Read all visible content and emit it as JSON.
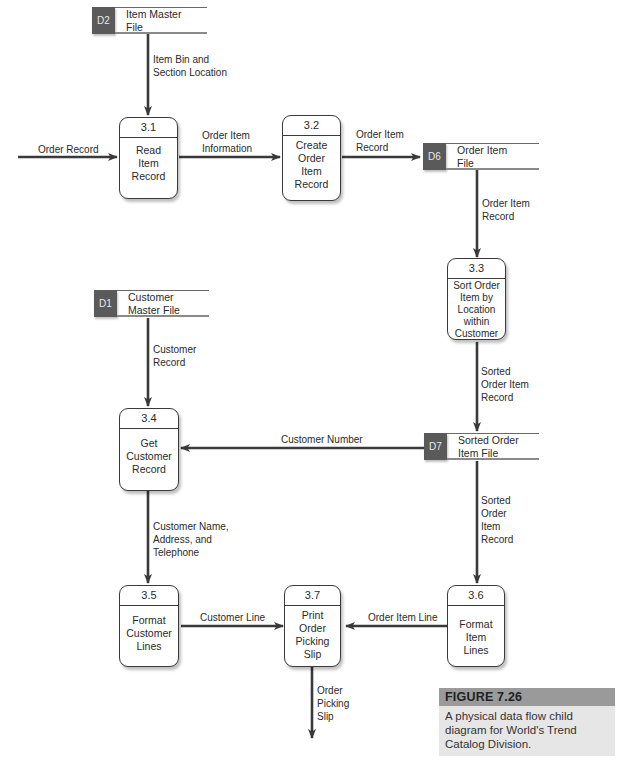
{
  "figure": {
    "title": "FIGURE 7.26",
    "caption": "A physical data flow child diagram for World's Trend Catalog Division."
  },
  "data_stores": {
    "d2": {
      "id": "D2",
      "name": "Item Master\nFile"
    },
    "d6": {
      "id": "D6",
      "name": "Order Item\nFile"
    },
    "d1": {
      "id": "D1",
      "name": "Customer\nMaster File"
    },
    "d7": {
      "id": "D7",
      "name": "Sorted Order\nItem File"
    }
  },
  "processes": {
    "p31": {
      "id": "3.1",
      "name": "Read\nItem\nRecord"
    },
    "p32": {
      "id": "3.2",
      "name": "Create\nOrder\nItem\nRecord"
    },
    "p33": {
      "id": "3.3",
      "name": "Sort Order\nItem by\nLocation\nwithin\nCustomer"
    },
    "p34": {
      "id": "3.4",
      "name": "Get\nCustomer\nRecord"
    },
    "p35": {
      "id": "3.5",
      "name": "Format\nCustomer\nLines"
    },
    "p36": {
      "id": "3.6",
      "name": "Format\nItem\nLines"
    },
    "p37": {
      "id": "3.7",
      "name": "Print\nOrder\nPicking\nSlip"
    }
  },
  "flows": {
    "item_bin": "Item Bin and\nSection Location",
    "order_record": "Order Record",
    "order_item_information": "Order Item\nInformation",
    "order_item_record_to_d6": "Order Item\nRecord",
    "order_item_record_from_d6": "Order Item\nRecord",
    "sorted_order_item_record_to_d7": "Sorted\nOrder Item\nRecord",
    "customer_record": "Customer\nRecord",
    "customer_number": "Customer Number",
    "sorted_order_item_record_from_d7": "Sorted\nOrder\nItem\nRecord",
    "customer_name_address": "Customer Name,\nAddress, and\nTelephone",
    "customer_line": "Customer Line",
    "order_item_line": "Order Item Line",
    "order_picking_slip": "Order\nPicking\nSlip"
  },
  "colors": {
    "line": "#3a3a3a",
    "store_id_bg": "#5a5a5a",
    "caption_header_bg": "#9a9a9a",
    "caption_bg": "#e6e6e6"
  }
}
